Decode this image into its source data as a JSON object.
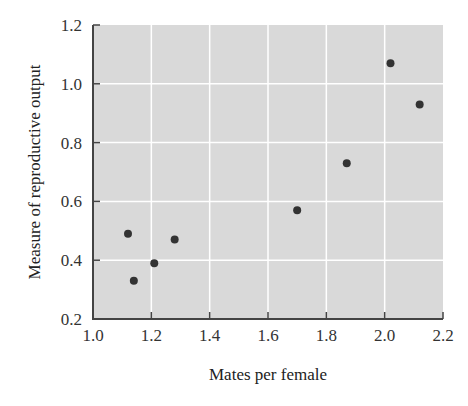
{
  "chart_data": {
    "type": "scatter",
    "title": "",
    "xlabel": "Mates per female",
    "ylabel": "Measure of reproductive output",
    "xlim": [
      1.0,
      2.2
    ],
    "ylim": [
      0.2,
      1.2
    ],
    "xticks": [
      "1.0",
      "1.2",
      "1.4",
      "1.6",
      "1.8",
      "2.0",
      "2.2"
    ],
    "yticks": [
      "0.2",
      "0.4",
      "0.6",
      "0.8",
      "1.0",
      "1.2"
    ],
    "grid": true,
    "legend": null,
    "series": [
      {
        "name": "observations",
        "points": [
          {
            "x": 1.12,
            "y": 0.49
          },
          {
            "x": 1.14,
            "y": 0.33
          },
          {
            "x": 1.21,
            "y": 0.39
          },
          {
            "x": 1.28,
            "y": 0.47
          },
          {
            "x": 1.7,
            "y": 0.57
          },
          {
            "x": 1.87,
            "y": 0.73
          },
          {
            "x": 2.02,
            "y": 1.07
          },
          {
            "x": 2.12,
            "y": 0.93
          }
        ]
      }
    ]
  },
  "colors": {
    "plot_background": "#d9d9d9",
    "grid": "#ffffff",
    "axis": "#444444",
    "point": "#333333"
  }
}
